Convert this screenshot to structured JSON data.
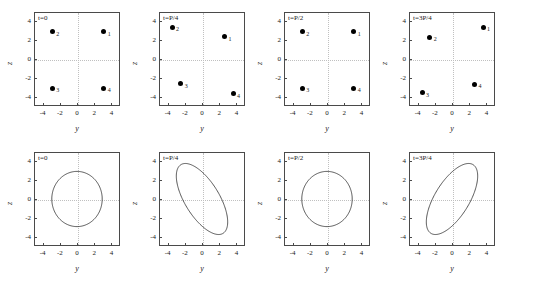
{
  "figure": {
    "rows": 2,
    "cols": 4,
    "xlabel": "y",
    "ylabel": "z"
  },
  "chart_data": [
    {
      "type": "scatter",
      "title": "t=0",
      "xlabel": "y",
      "ylabel": "z",
      "xlim": [
        -5,
        5
      ],
      "ylim": [
        -5,
        5
      ],
      "xticks": [
        -4,
        -2,
        0,
        2,
        4
      ],
      "yticks": [
        4,
        2,
        0,
        -2,
        -4
      ],
      "grid": true,
      "points": [
        {
          "label": "1",
          "x": 3.0,
          "y": 3.0
        },
        {
          "label": "2",
          "x": -3.0,
          "y": 3.0
        },
        {
          "label": "3",
          "x": -3.0,
          "y": -3.0
        },
        {
          "label": "4",
          "x": 3.0,
          "y": -3.0
        }
      ]
    },
    {
      "type": "scatter",
      "title": "t=P/4",
      "xlabel": "y",
      "ylabel": "z",
      "xlim": [
        -5,
        5
      ],
      "ylim": [
        -5,
        5
      ],
      "xticks": [
        -4,
        -2,
        0,
        2,
        4
      ],
      "yticks": [
        4,
        2,
        0,
        -2,
        -4
      ],
      "grid": true,
      "points": [
        {
          "label": "1",
          "x": 2.5,
          "y": 2.5
        },
        {
          "label": "2",
          "x": -3.6,
          "y": 3.5
        },
        {
          "label": "3",
          "x": -2.6,
          "y": -2.5
        },
        {
          "label": "4",
          "x": 3.5,
          "y": -3.6
        }
      ]
    },
    {
      "type": "scatter",
      "title": "t=P/2",
      "xlabel": "y",
      "ylabel": "z",
      "xlim": [
        -5,
        5
      ],
      "ylim": [
        -5,
        5
      ],
      "xticks": [
        -4,
        -2,
        0,
        2,
        4
      ],
      "yticks": [
        4,
        2,
        0,
        -2,
        -4
      ],
      "grid": true,
      "points": [
        {
          "label": "1",
          "x": 3.0,
          "y": 3.0
        },
        {
          "label": "2",
          "x": -3.0,
          "y": 3.0
        },
        {
          "label": "3",
          "x": -3.0,
          "y": -3.0
        },
        {
          "label": "4",
          "x": 3.0,
          "y": -3.0
        }
      ]
    },
    {
      "type": "scatter",
      "title": "t=3P/4",
      "xlabel": "y",
      "ylabel": "z",
      "xlim": [
        -5,
        5
      ],
      "ylim": [
        -5,
        5
      ],
      "xticks": [
        -4,
        -2,
        0,
        2,
        4
      ],
      "yticks": [
        4,
        2,
        0,
        -2,
        -4
      ],
      "grid": true,
      "points": [
        {
          "label": "1",
          "x": 3.5,
          "y": 3.5
        },
        {
          "label": "2",
          "x": -2.7,
          "y": 2.4
        },
        {
          "label": "3",
          "x": -3.6,
          "y": -3.5
        },
        {
          "label": "4",
          "x": 2.5,
          "y": -2.6
        }
      ]
    },
    {
      "type": "line",
      "title": "t=0",
      "xlabel": "y",
      "ylabel": "z",
      "xlim": [
        -5,
        5
      ],
      "ylim": [
        -5,
        5
      ],
      "xticks": [
        -4,
        -2,
        0,
        2,
        4
      ],
      "yticks": [
        4,
        2,
        0,
        -2,
        -4
      ],
      "grid": true,
      "shape": "ellipse",
      "semi_major": 3.0,
      "semi_minor": 3.0,
      "rotation_deg": 0,
      "center": [
        0,
        0
      ]
    },
    {
      "type": "line",
      "title": "t=P/4",
      "xlabel": "y",
      "ylabel": "z",
      "xlim": [
        -5,
        5
      ],
      "ylim": [
        -5,
        5
      ],
      "xticks": [
        -4,
        -2,
        0,
        2,
        4
      ],
      "yticks": [
        4,
        2,
        0,
        -2,
        -4
      ],
      "grid": true,
      "shape": "ellipse",
      "semi_major": 4.5,
      "semi_minor": 2.0,
      "rotation_deg": -55,
      "center": [
        0,
        0
      ]
    },
    {
      "type": "line",
      "title": "t=P/2",
      "xlabel": "y",
      "ylabel": "z",
      "xlim": [
        -5,
        5
      ],
      "ylim": [
        -5,
        5
      ],
      "xticks": [
        -4,
        -2,
        0,
        2,
        4
      ],
      "yticks": [
        4,
        2,
        0,
        -2,
        -4
      ],
      "grid": true,
      "shape": "ellipse",
      "semi_major": 3.0,
      "semi_minor": 3.0,
      "rotation_deg": 0,
      "center": [
        0,
        0
      ]
    },
    {
      "type": "line",
      "title": "t=3P/4",
      "xlabel": "y",
      "ylabel": "z",
      "xlim": [
        -5,
        5
      ],
      "ylim": [
        -5,
        5
      ],
      "xticks": [
        -4,
        -2,
        0,
        2,
        4
      ],
      "yticks": [
        4,
        2,
        0,
        -2,
        -4
      ],
      "grid": true,
      "shape": "ellipse",
      "semi_major": 4.5,
      "semi_minor": 2.0,
      "rotation_deg": 55,
      "center": [
        0,
        0
      ]
    }
  ],
  "colors": {
    "frame": "#4a4a4a",
    "grid": "#c0c0c0",
    "marker": "#000000",
    "curve": "#2a2a2a",
    "text": "#1a1a1a",
    "background": "#ffffff"
  }
}
